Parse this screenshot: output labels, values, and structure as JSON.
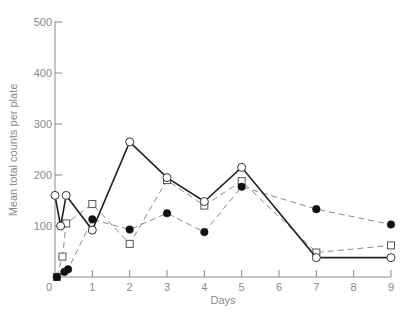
{
  "chart_data": {
    "type": "line",
    "title": "",
    "xlabel": "Days",
    "ylabel": "Mean total counts per plate",
    "xlim": [
      0,
      9
    ],
    "ylim": [
      0,
      500
    ],
    "x_ticks": [
      0,
      1,
      2,
      3,
      4,
      5,
      6,
      7,
      8,
      9
    ],
    "y_ticks": [
      100,
      200,
      300,
      400,
      500
    ],
    "y_tick_labels": [
      "100",
      "200",
      "300",
      "400",
      "500"
    ],
    "x_tick_labels": [
      "0",
      "1",
      "2",
      "3",
      "4",
      "5",
      "6",
      "7",
      "8",
      "9"
    ],
    "grid": false,
    "legend": null,
    "series": [
      {
        "name": "open-circles",
        "marker": "open-circle",
        "line": "solid",
        "x": [
          0,
          0.15,
          0.3,
          1,
          2,
          3,
          4,
          5,
          7,
          9
        ],
        "values": [
          160,
          100,
          160,
          92,
          265,
          195,
          148,
          215,
          38,
          38
        ]
      },
      {
        "name": "open-squares",
        "marker": "open-square",
        "line": "dashed",
        "x": [
          0.05,
          0.2,
          0.3,
          1,
          2,
          3,
          4,
          5,
          7,
          9
        ],
        "values": [
          0,
          40,
          105,
          143,
          65,
          190,
          140,
          188,
          48,
          62
        ]
      },
      {
        "name": "filled-circles",
        "marker": "filled-circle",
        "line": "dashed",
        "x": [
          0.05,
          0.25,
          0.35,
          1,
          2,
          3,
          4,
          5,
          7,
          9
        ],
        "values": [
          0,
          10,
          15,
          113,
          93,
          125,
          88,
          177,
          133,
          103
        ]
      }
    ]
  },
  "axis": {
    "x_title": "Days",
    "y_title": "Mean total counts per plate",
    "origin_label": "0"
  }
}
